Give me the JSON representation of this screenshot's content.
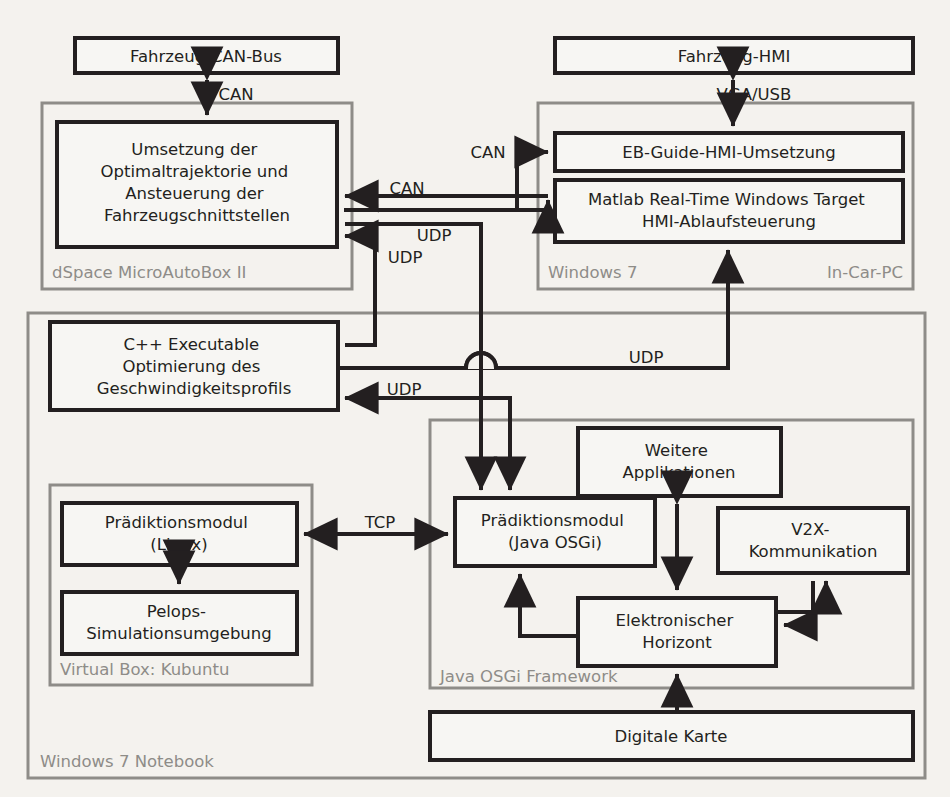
{
  "diagram": {
    "colors": {
      "background": "#f4f2ee",
      "box_fill": "#f7f6f3",
      "box_stroke": "#231f20",
      "container_stroke": "#8e8c88",
      "container_label": "#8e8c88"
    },
    "containers": [
      {
        "id": "dspace",
        "label": "dSpace MicroAutoBox II",
        "label_align": "left"
      },
      {
        "id": "incar",
        "label": "Windows 7",
        "label_align": "left"
      },
      {
        "id": "incar2",
        "label": "In-Car-PC",
        "label_align": "right"
      },
      {
        "id": "notebook",
        "label": "Windows 7 Notebook",
        "label_align": "left"
      },
      {
        "id": "vbox",
        "label": "Virtual Box: Kubuntu",
        "label_align": "left"
      },
      {
        "id": "osgi",
        "label": "Java OSGi Framework",
        "label_align": "left"
      }
    ],
    "boxes": [
      {
        "id": "can_bus",
        "lines": [
          "Fahrzeug-CAN-Bus"
        ]
      },
      {
        "id": "umsetzung",
        "lines": [
          "Umsetzung der",
          "Optimaltrajektorie und",
          "Ansteuerung der",
          "Fahrzeugschnittstellen"
        ]
      },
      {
        "id": "hmi",
        "lines": [
          "Fahrzeug-HMI"
        ]
      },
      {
        "id": "ebguide",
        "lines": [
          "EB-Guide-HMI-Umsetzung"
        ]
      },
      {
        "id": "matlab",
        "lines": [
          "Matlab Real-Time Windows Target",
          "HMI-Ablaufsteuerung"
        ]
      },
      {
        "id": "cpp",
        "lines": [
          "C++ Executable",
          "Optimierung des",
          "Geschwindigkeitsprofils"
        ]
      },
      {
        "id": "praed_lin",
        "lines": [
          "Prädiktionsmodul",
          "(Linux)"
        ]
      },
      {
        "id": "pelops",
        "lines": [
          "Pelops-",
          "Simulationsumgebung"
        ]
      },
      {
        "id": "praed_osgi",
        "lines": [
          "Prädiktionsmodul",
          "(Java OSGi)"
        ]
      },
      {
        "id": "weitere",
        "lines": [
          "Weitere",
          "Applikationen"
        ]
      },
      {
        "id": "v2x",
        "lines": [
          "V2X-",
          "Kommunikation"
        ]
      },
      {
        "id": "ehorizont",
        "lines": [
          "Elektronischer",
          "Horizont"
        ]
      },
      {
        "id": "karte",
        "lines": [
          "Digitale Karte"
        ]
      }
    ],
    "edge_labels": [
      {
        "id": "can_top",
        "text": "CAN"
      },
      {
        "id": "vga_usb",
        "text": "VGA/USB"
      },
      {
        "id": "can_branch",
        "text": "CAN"
      },
      {
        "id": "can_main",
        "text": "CAN"
      },
      {
        "id": "udp_up",
        "text": "UDP"
      },
      {
        "id": "udp_left",
        "text": "UDP"
      },
      {
        "id": "udp_right",
        "text": "UDP"
      },
      {
        "id": "udp_back",
        "text": "UDP"
      },
      {
        "id": "tcp",
        "text": "TCP"
      }
    ]
  }
}
